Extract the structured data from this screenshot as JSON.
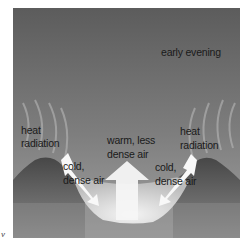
{
  "diagram": {
    "time_label": "early evening",
    "labels": {
      "heat_radiation_left_1": "heat",
      "heat_radiation_left_2": "radiation",
      "heat_radiation_right_1": "heat",
      "heat_radiation_right_2": "radiation",
      "cold_air_left_1": "cold,",
      "cold_air_left_2": "dense air",
      "cold_air_right_1": "cold,",
      "cold_air_right_2": "dense air",
      "warm_air_1": "warm, less",
      "warm_air_2": "dense air"
    },
    "corner_mark": "v",
    "colors": {
      "sky_top": "#5e5e5e",
      "sky_bottom": "#9a9a9a",
      "hills": "#505050",
      "valley_air": "#e6e6e6",
      "arrows": "#f8f8f8"
    }
  }
}
